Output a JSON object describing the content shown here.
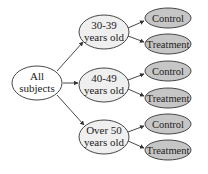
{
  "colors": {
    "root_fill": "#ffffff",
    "group_fill": "#efefef",
    "leaf_fill": "#c6c6c6",
    "stroke": "#333333"
  },
  "root": {
    "line1": "All",
    "line2": "subjects"
  },
  "groups": [
    {
      "line1": "30-39",
      "line2": "years old",
      "children": [
        {
          "label": "Control"
        },
        {
          "label": "Treatment"
        }
      ]
    },
    {
      "line1": "40-49",
      "line2": "years old",
      "children": [
        {
          "label": "Control"
        },
        {
          "label": "Treatment"
        }
      ]
    },
    {
      "line1": "Over 50",
      "line2": "years old",
      "children": [
        {
          "label": "Control"
        },
        {
          "label": "Treatment"
        }
      ]
    }
  ]
}
